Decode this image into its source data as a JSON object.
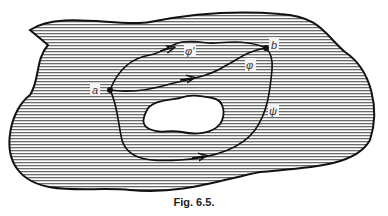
{
  "figure": {
    "caption": "Fig. 6.5.",
    "region": {
      "description": "Hatched region with a hole (not simply connected)",
      "hatch": "horizontal lines",
      "hatch_color": "#555555",
      "outline_color": "#111111"
    },
    "hole": {
      "fill": "#ffffff"
    },
    "points": [
      {
        "id": "a",
        "label": "a"
      },
      {
        "id": "b",
        "label": "b"
      }
    ],
    "paths": [
      {
        "id": "phi-prime",
        "label": "φ'",
        "from": "a",
        "to": "b",
        "description": "upper path from a to b"
      },
      {
        "id": "phi",
        "label": "φ",
        "from": "a",
        "to": "b",
        "description": "middle path from a to b"
      },
      {
        "id": "psi",
        "label": "ψ",
        "from": "a",
        "to": "b",
        "description": "path going around the hole below and to the right"
      }
    ]
  }
}
